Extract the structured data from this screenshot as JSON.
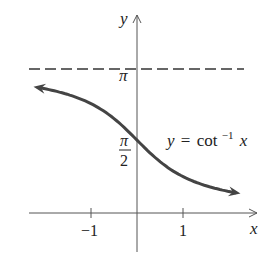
{
  "chart_data": {
    "type": "line",
    "title": "",
    "function_label": {
      "lhs": "y",
      "eq": "=",
      "fn": "cot",
      "sup": "−1",
      "arg": "x"
    },
    "xlabel": "x",
    "ylabel": "y",
    "x_ticks": [
      {
        "value": -1,
        "label": "−1"
      },
      {
        "value": 1,
        "label": "1"
      }
    ],
    "y_ticks": [
      {
        "value": 1.5708,
        "label_num": "π",
        "label_den": "2"
      },
      {
        "value": 3.1416,
        "label": "π"
      }
    ],
    "asymptote": {
      "y": 3.1416,
      "style": "dashed",
      "label": "π"
    },
    "xlim": [
      -2.3,
      2.6
    ],
    "ylim": [
      -0.85,
      4.3
    ],
    "grid": false,
    "series": [
      {
        "name": "y = cot⁻¹ x",
        "x": [
          -2.25,
          -2.0,
          -1.5,
          -1.0,
          -0.5,
          0.0,
          0.5,
          1.0,
          1.5,
          2.0,
          2.25
        ],
        "y": [
          2.723,
          2.678,
          2.554,
          2.356,
          2.034,
          1.571,
          1.107,
          0.785,
          0.588,
          0.464,
          0.418
        ],
        "arrows": "both"
      }
    ],
    "colors": {
      "curve": "#444444",
      "axes": "#555555",
      "text": "#222222"
    }
  }
}
